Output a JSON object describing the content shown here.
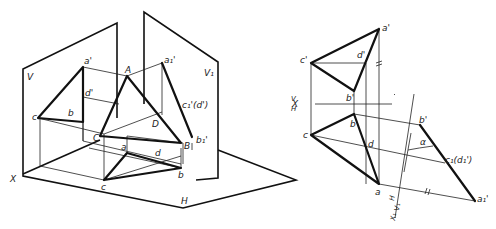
{
  "left_figure": {
    "planes": {
      "V": "V",
      "V1": "V₁",
      "H": "H",
      "X": "X"
    },
    "points": {
      "a_prime": "a'",
      "a1_prime": "a₁'",
      "A": "A",
      "d_prime": "d'",
      "c1_d_prime": "c₁'(d')",
      "c_v": "c",
      "b_v": "b",
      "C": "C",
      "D": "D",
      "a_h": "a",
      "d_h": "d",
      "B": "B",
      "b1_prime": "b₁'",
      "c_h": "c",
      "b_h": "b"
    }
  },
  "right_figure": {
    "axis_vh": {
      "X": "X",
      "V": "V",
      "H": "H"
    },
    "axis_h_v1": {
      "X1": "X₁",
      "H": "H",
      "V1": "V₁"
    },
    "points": {
      "a_prime": "a'",
      "c_prime": "c'",
      "d_prime": "d'",
      "b_prime": "b'",
      "c": "c",
      "b": "b",
      "d": "d",
      "a": "a",
      "b1_prime": "b'",
      "c1_d1": "c₁(d₁')",
      "a1_prime": "a₁'"
    },
    "angle": "α",
    "equal_mark": "//"
  }
}
